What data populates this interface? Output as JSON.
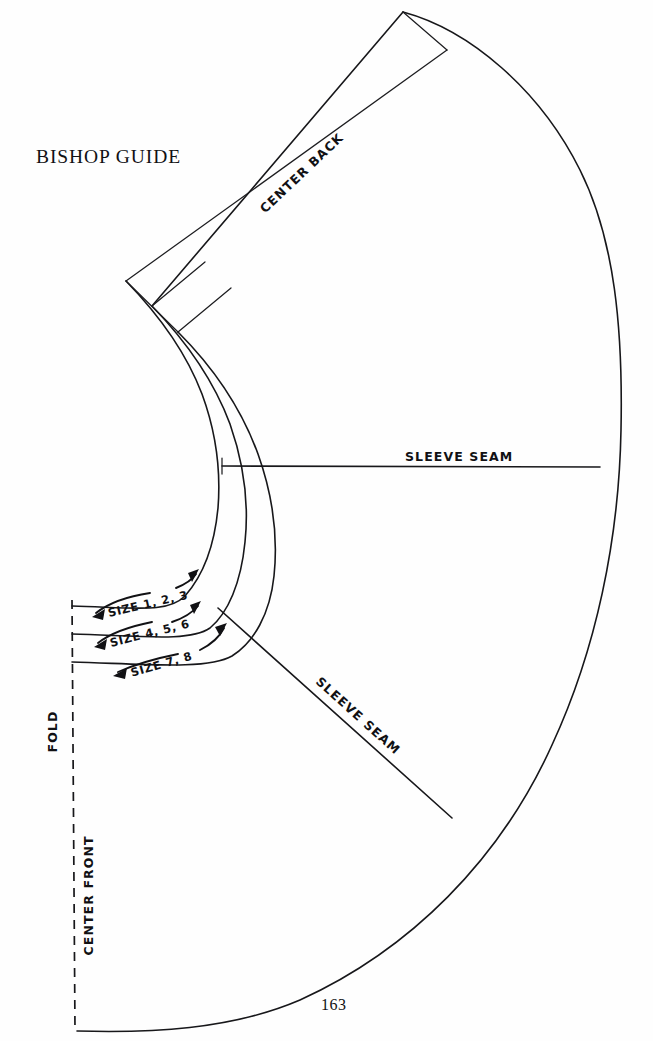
{
  "page": {
    "title": "BISHOP GUIDE",
    "folio": "163",
    "background_color": "#fefefe",
    "ink_color": "#17171a"
  },
  "labels": {
    "center_back": "CENTER BACK",
    "sleeve_seam_upper": "SLEEVE SEAM",
    "sleeve_seam_lower": "SLEEVE SEAM",
    "fold": "FOLD",
    "center_front": "CENTER FRONT"
  },
  "size_bands": [
    {
      "label": "SIZE 1, 2, 3",
      "sizes": [
        1,
        2,
        3
      ]
    },
    {
      "label": "SIZE 4, 5, 6",
      "sizes": [
        4,
        5,
        6
      ]
    },
    {
      "label": "SIZE 7, 8",
      "sizes": [
        7,
        8
      ]
    }
  ],
  "diagram": {
    "type": "sewing-pattern-piece",
    "piece_name": "Bishop sleeve guide",
    "pivot": {
      "x": 222,
      "y": 466
    },
    "outer_arc_radius": 399,
    "neckline_arc_radii": [
      150,
      178,
      206
    ],
    "fold_line": {
      "x": 72,
      "y_top": 618,
      "y_bottom": 1031,
      "style": "dashed"
    },
    "seam_lines": [
      {
        "name": "sleeve-seam-upper",
        "angle_deg": 0
      },
      {
        "name": "sleeve-seam-lower",
        "angle_deg": 43
      },
      {
        "name": "center-back",
        "angle_deg": -44
      }
    ]
  }
}
